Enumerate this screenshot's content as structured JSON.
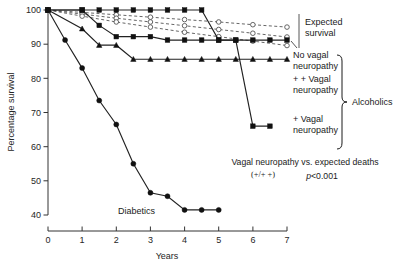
{
  "chart_data": {
    "type": "line",
    "title": "",
    "xlabel": "Years",
    "ylabel": "Percentage survival",
    "xlim": [
      0,
      7
    ],
    "ylim": [
      40,
      100
    ],
    "xticks": [
      "0",
      "1",
      "2",
      "3",
      "4",
      "5",
      "6",
      "7"
    ],
    "yticks": [
      "40",
      "50",
      "60",
      "70",
      "80",
      "90",
      "100"
    ],
    "grid": false,
    "legend_position": "right-inline-labels",
    "series": [
      {
        "name": "Expected survival (upper)",
        "group": "Expected survival",
        "style": "dashed",
        "marker": "open-circle",
        "x": [
          0,
          1,
          2,
          3,
          4,
          5,
          6,
          7
        ],
        "values": [
          100,
          99.3,
          98.6,
          97.9,
          97.2,
          96.5,
          95.7,
          95.0
        ]
      },
      {
        "name": "Expected survival (middle)",
        "group": "Expected survival",
        "style": "dashed",
        "marker": "open-circle",
        "x": [
          0,
          1,
          2,
          3,
          4,
          5,
          6,
          7
        ],
        "values": [
          100,
          98.8,
          97.6,
          96.5,
          95.4,
          94.3,
          93.2,
          92.1
        ]
      },
      {
        "name": "Expected survival (lower)",
        "group": "Expected survival",
        "style": "dashed",
        "marker": "open-circle",
        "x": [
          0,
          1,
          2,
          3,
          4,
          5,
          6,
          7
        ],
        "values": [
          100,
          98.2,
          96.5,
          95.0,
          93.5,
          92.2,
          90.9,
          89.6
        ]
      },
      {
        "name": "No vagal neuropathy",
        "group": "Alcoholics",
        "style": "solid",
        "marker": "filled-square",
        "x": [
          0,
          1,
          1.5,
          2,
          2.5,
          3,
          3.5,
          4,
          4.5,
          5,
          5.5,
          6,
          6.5,
          7
        ],
        "values": [
          100,
          100,
          95.5,
          92.2,
          92.2,
          92.2,
          91.2,
          91.2,
          91.2,
          91.2,
          91.2,
          91.2,
          91.2,
          91.2
        ]
      },
      {
        "name": "+ + Vagal neuropathy",
        "group": "Alcoholics",
        "style": "solid",
        "marker": "filled-triangle",
        "x": [
          0,
          1,
          1.5,
          2,
          2.5,
          3,
          3.5,
          4,
          4.5,
          5,
          5.5,
          6,
          6.5,
          7
        ],
        "values": [
          100,
          94.5,
          89.7,
          89.7,
          85.6,
          85.6,
          85.6,
          85.6,
          85.6,
          85.6,
          85.6,
          85.6,
          85.6,
          85.6
        ]
      },
      {
        "name": "+ Vagal neuropathy",
        "group": "Alcoholics",
        "style": "solid",
        "marker": "filled-square",
        "x": [
          0,
          1,
          1.5,
          2,
          2.5,
          3,
          3.5,
          4,
          4.5,
          5,
          5.5,
          6,
          6.5
        ],
        "values": [
          100,
          100,
          100,
          100,
          100,
          100,
          100,
          100,
          100,
          91.2,
          91.2,
          66.0,
          66.0
        ]
      },
      {
        "name": "Diabetics",
        "group": "Diabetics",
        "style": "solid",
        "marker": "filled-circle",
        "x": [
          0,
          0.5,
          1,
          1.5,
          2,
          2.5,
          3,
          3.5,
          4,
          4.5,
          5
        ],
        "values": [
          100,
          91.2,
          83.0,
          73.5,
          66.5,
          55.0,
          46.5,
          45.5,
          41.5,
          41.5,
          41.5
        ]
      }
    ],
    "annotations": [
      {
        "id": "expected-survival",
        "text_line_1": "Expected",
        "text_line_2": "survival"
      },
      {
        "id": "no-vagal",
        "text_line_1": "No vagal",
        "text_line_2": "neuropathy"
      },
      {
        "id": "plus-plus-vagal",
        "text_line_1": "+ + Vagal",
        "text_line_2": "neuropathy"
      },
      {
        "id": "plus-vagal",
        "text_line_1": "+ Vagal",
        "text_line_2": "neuropathy"
      },
      {
        "id": "alcoholics",
        "text_line_1": "Alcoholics"
      },
      {
        "id": "diabetics",
        "text_line_1": "Diabetics"
      }
    ],
    "statistics": {
      "comparison_line_1": "Vagal neuropathy vs. expected deaths",
      "comparison_line_2": "(+/+ +)",
      "p_italic": "p",
      "p_value": "<0.001"
    }
  }
}
